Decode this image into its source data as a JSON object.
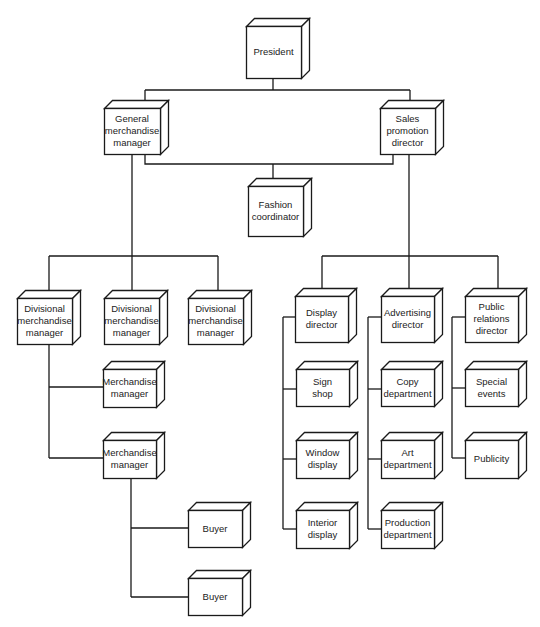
{
  "diagram": {
    "type": "organization-chart",
    "colors": {
      "line": "#1a1a1a",
      "box_fill": "#ffffff",
      "text": "#222222"
    },
    "nodes": [
      {
        "id": "president",
        "label": "President",
        "x": 246,
        "y": 26,
        "w": 55,
        "h": 52
      },
      {
        "id": "gmm",
        "label": "General\nmerchandise\nmanager",
        "x": 104,
        "y": 108,
        "w": 56,
        "h": 46
      },
      {
        "id": "spd",
        "label": "Sales\npromotion\ndirector",
        "x": 380,
        "y": 108,
        "w": 55,
        "h": 46
      },
      {
        "id": "fashion",
        "label": "Fashion\ncoordinator",
        "x": 248,
        "y": 186,
        "w": 55,
        "h": 50
      },
      {
        "id": "dmm1",
        "label": "Divisional\nmerchandise\nmanager",
        "x": 17,
        "y": 298,
        "w": 55,
        "h": 46
      },
      {
        "id": "dmm2",
        "label": "Divisional\nmerchandise\nmanager",
        "x": 104,
        "y": 298,
        "w": 55,
        "h": 46
      },
      {
        "id": "dmm3",
        "label": "Divisional\nmerchandise\nmanager",
        "x": 188,
        "y": 298,
        "w": 55,
        "h": 46
      },
      {
        "id": "mm1",
        "label": "Merchandise\nmanager",
        "x": 103,
        "y": 369,
        "w": 53,
        "h": 38
      },
      {
        "id": "mm2",
        "label": "Merchandise\nmanager",
        "x": 103,
        "y": 440,
        "w": 53,
        "h": 38
      },
      {
        "id": "buyer1",
        "label": "Buyer",
        "x": 188,
        "y": 510,
        "w": 54,
        "h": 37
      },
      {
        "id": "buyer2",
        "label": "Buyer",
        "x": 188,
        "y": 578,
        "w": 54,
        "h": 37
      },
      {
        "id": "display",
        "label": "Display\ndirector",
        "x": 295,
        "y": 296,
        "w": 53,
        "h": 46
      },
      {
        "id": "advertising",
        "label": "Advertising\ndirector",
        "x": 381,
        "y": 296,
        "w": 53,
        "h": 46
      },
      {
        "id": "pr",
        "label": "Public\nrelations\ndirector",
        "x": 465,
        "y": 296,
        "w": 53,
        "h": 46
      },
      {
        "id": "sign",
        "label": "Sign\nshop",
        "x": 296,
        "y": 369,
        "w": 53,
        "h": 37
      },
      {
        "id": "window",
        "label": "Window\ndisplay",
        "x": 296,
        "y": 440,
        "w": 53,
        "h": 38
      },
      {
        "id": "interior",
        "label": "Interior\ndisplay",
        "x": 296,
        "y": 510,
        "w": 53,
        "h": 38
      },
      {
        "id": "copy",
        "label": "Copy\ndepartment",
        "x": 381,
        "y": 369,
        "w": 53,
        "h": 37
      },
      {
        "id": "art",
        "label": "Art\ndepartment",
        "x": 381,
        "y": 440,
        "w": 53,
        "h": 38
      },
      {
        "id": "production",
        "label": "Production\ndepartment",
        "x": 381,
        "y": 510,
        "w": 53,
        "h": 38
      },
      {
        "id": "special",
        "label": "Special\nevents",
        "x": 465,
        "y": 369,
        "w": 53,
        "h": 37
      },
      {
        "id": "publicity",
        "label": "Publicity",
        "x": 465,
        "y": 440,
        "w": 53,
        "h": 38
      }
    ],
    "edges": [
      [
        "president",
        "gmm"
      ],
      [
        "president",
        "spd"
      ],
      [
        "gmm",
        "fashion"
      ],
      [
        "spd",
        "fashion"
      ],
      [
        "gmm",
        "dmm1"
      ],
      [
        "gmm",
        "dmm2"
      ],
      [
        "gmm",
        "dmm3"
      ],
      [
        "dmm1",
        "mm1"
      ],
      [
        "dmm1",
        "mm2"
      ],
      [
        "mm2",
        "buyer1"
      ],
      [
        "mm2",
        "buyer2"
      ],
      [
        "spd",
        "display"
      ],
      [
        "spd",
        "advertising"
      ],
      [
        "spd",
        "pr"
      ],
      [
        "display",
        "sign"
      ],
      [
        "display",
        "window"
      ],
      [
        "display",
        "interior"
      ],
      [
        "advertising",
        "copy"
      ],
      [
        "advertising",
        "art"
      ],
      [
        "advertising",
        "production"
      ],
      [
        "pr",
        "special"
      ],
      [
        "pr",
        "publicity"
      ]
    ]
  }
}
